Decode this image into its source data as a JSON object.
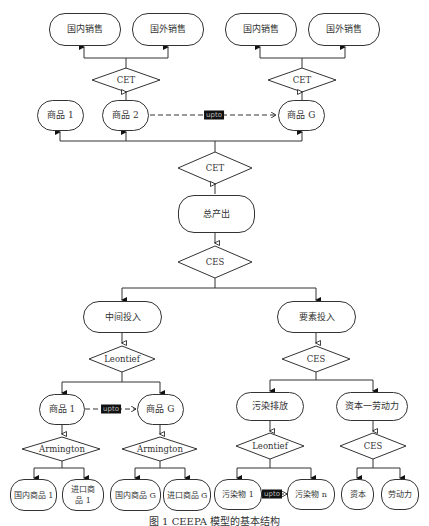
{
  "diagram": {
    "top_left": {
      "sale_domestic": "国内销售",
      "sale_foreign": "国外销售",
      "cet": "CET"
    },
    "top_right": {
      "sale_domestic": "国内销售",
      "sale_foreign": "国外销售",
      "cet": "CET"
    },
    "goods_row": {
      "good1": "商品 1",
      "good2": "商品 2",
      "goodG": "商品 G",
      "tag": "upto"
    },
    "cet_main": "CET",
    "total_output": "总产出",
    "ces_main": "CES",
    "intermediate": {
      "title": "中间投入",
      "op": "Leontief",
      "good1": "商品 1",
      "goodG": "商品 G",
      "tag": "upto",
      "armington1": "Armington",
      "armingtonG": "Armington",
      "dom1": "国内商品 1",
      "imp1": "进口商品 1",
      "domG": "国内商品 G",
      "impG": "进口商品 G"
    },
    "factor": {
      "title": "要素投入",
      "op": "CES",
      "pollution": "污染排放",
      "capital_labor": "资本一劳动力",
      "leontief": "Leontief",
      "ces": "CES",
      "pollutant1": "污染物 1",
      "pollutantN": "污染物 n",
      "tag": "upto",
      "capital": "资本",
      "labor": "劳动力"
    },
    "caption": "图 1  CEEPA 模型的基本结构"
  }
}
